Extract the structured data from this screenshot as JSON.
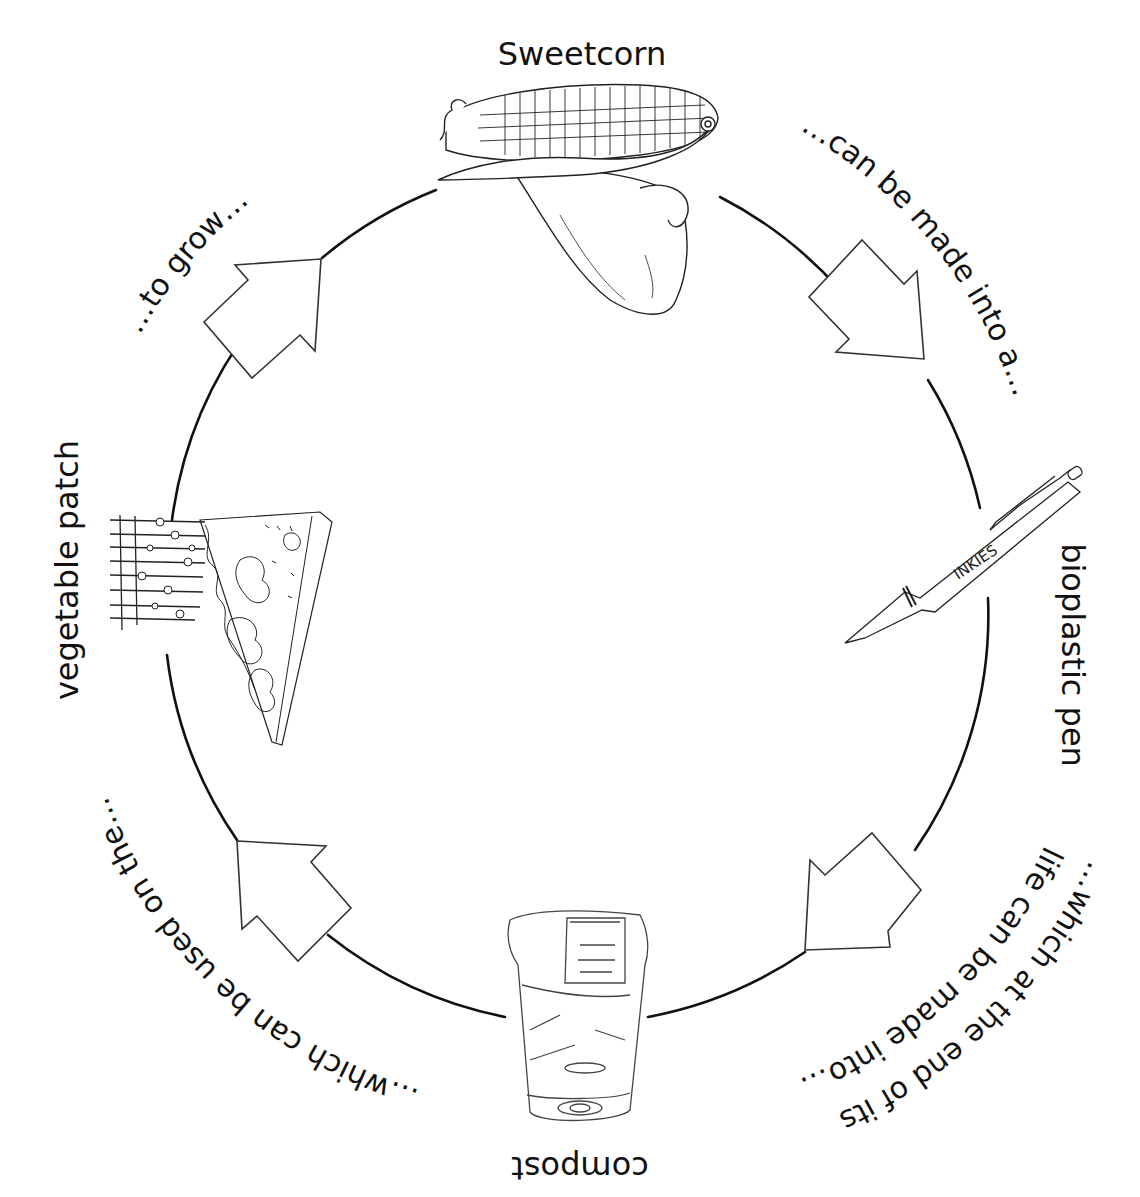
{
  "diagram": {
    "type": "cycle",
    "stages": [
      {
        "id": "sweetcorn",
        "label": "Sweetcorn",
        "icon": "corn-cob-icon"
      },
      {
        "id": "pen",
        "label": "bioplastic pen",
        "icon": "pen-icon",
        "pen_brand": "INKIES"
      },
      {
        "id": "compost",
        "label": "compost",
        "icon": "compost-cup-icon"
      },
      {
        "id": "vegetable-patch",
        "label": "vegetable patch",
        "icon": "vegetable-patch-icon"
      }
    ],
    "transitions": [
      {
        "from": "sweetcorn",
        "to": "pen",
        "text": "…can be made into a…"
      },
      {
        "from": "pen",
        "to": "compost",
        "text_line1": "…which at the end of its",
        "text_line2": "life can be made into…"
      },
      {
        "from": "compost",
        "to": "vegetable-patch",
        "text": "…which can be used on the…"
      },
      {
        "from": "vegetable-patch",
        "to": "sweetcorn",
        "text": "…to grow…"
      }
    ],
    "colors": {
      "line": "#111111",
      "arrow_fill": "#ffffff",
      "background": "#ffffff"
    }
  }
}
